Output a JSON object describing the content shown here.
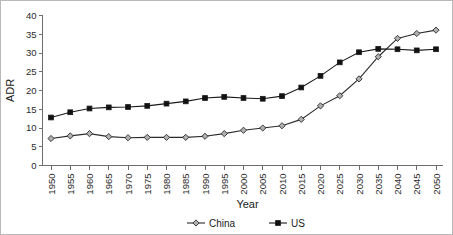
{
  "chart_data": {
    "type": "line",
    "title": "",
    "xlabel": "Year",
    "ylabel": "ADR",
    "xlim": [
      1950,
      2050
    ],
    "ylim": [
      0,
      40
    ],
    "yticks": [
      0,
      5,
      10,
      15,
      20,
      25,
      30,
      35,
      40
    ],
    "grid": false,
    "legend_position": "bottom-center",
    "categories": [
      1950,
      1955,
      1960,
      1965,
      1970,
      1975,
      1980,
      1985,
      1990,
      1995,
      2000,
      2005,
      2010,
      2015,
      2020,
      2025,
      2030,
      2035,
      2040,
      2045,
      2050
    ],
    "xticklabels": [
      "1950",
      "1955",
      "1960",
      "1965",
      "1970",
      "1975",
      "1980",
      "1985",
      "1990",
      "1995",
      "2000",
      "2005",
      "2010",
      "2015",
      "2020",
      "2025",
      "2030",
      "2035",
      "2040",
      "2045",
      "2050"
    ],
    "yticklabels": [
      "0",
      "5",
      "10",
      "15",
      "20",
      "25",
      "30",
      "35",
      "40"
    ],
    "series": [
      {
        "name": "China",
        "marker": "open-diamond",
        "color": "#2b2b2b",
        "marker_fill": "#b0b0b0",
        "values": [
          7.2,
          7.9,
          8.5,
          7.7,
          7.4,
          7.5,
          7.5,
          7.5,
          7.8,
          8.5,
          9.4,
          10.0,
          10.6,
          12.3,
          15.9,
          18.6,
          23.1,
          29.0,
          33.9,
          35.2,
          36.1
        ]
      },
      {
        "name": "US",
        "marker": "filled-square",
        "color": "#1a1a1a",
        "marker_fill": "#111111",
        "values": [
          12.8,
          14.2,
          15.2,
          15.5,
          15.6,
          15.9,
          16.5,
          17.1,
          18.0,
          18.3,
          18.0,
          17.8,
          18.5,
          20.8,
          23.9,
          27.5,
          30.2,
          31.1,
          31.0,
          30.7,
          31.0
        ]
      }
    ]
  },
  "legend": {
    "items": [
      {
        "label": "China"
      },
      {
        "label": "US"
      }
    ]
  }
}
